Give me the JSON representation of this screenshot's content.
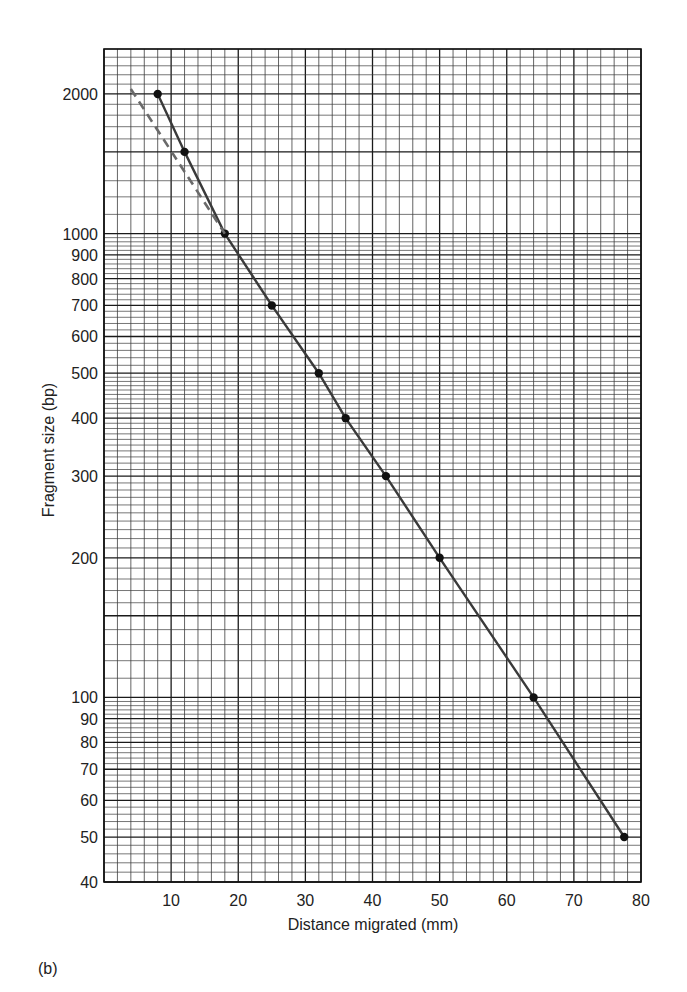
{
  "panel_label": "(b)",
  "chart_data": {
    "type": "line",
    "title": "",
    "xlabel": "Distance migrated (mm)",
    "ylabel": "Fragment size (bp)",
    "xlim": [
      0,
      80
    ],
    "ylim": [
      40,
      2500
    ],
    "yscale": "log",
    "grid": true,
    "x_ticks": [
      10,
      20,
      30,
      40,
      50,
      60,
      70,
      80
    ],
    "y_ticks": [
      40,
      50,
      60,
      70,
      80,
      90,
      100,
      200,
      300,
      400,
      500,
      600,
      700,
      800,
      900,
      1000,
      2000
    ],
    "series": [
      {
        "name": "Measured standards",
        "style": "solid",
        "markers": true,
        "color": "#3a3a3a",
        "x": [
          8,
          12,
          18,
          25,
          32,
          36,
          42,
          50,
          64,
          77.5
        ],
        "y": [
          2000,
          1500,
          1000,
          700,
          500,
          400,
          300,
          200,
          100,
          50
        ]
      },
      {
        "name": "Linear extrapolation",
        "style": "dashed",
        "markers": false,
        "color": "#6a6a6a",
        "x": [
          4,
          18
        ],
        "y": [
          2050,
          1000
        ]
      }
    ],
    "legend": null
  },
  "colors": {
    "grid_minor": "#3c3c3c",
    "grid_major": "#1a1a1a",
    "marker": "#111111"
  }
}
